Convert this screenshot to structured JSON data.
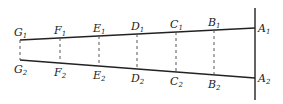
{
  "diagram": {
    "type": "geometric-figure",
    "colors": {
      "line": "#222222",
      "background": "#ffffff"
    },
    "vertical_line": {
      "x": 255,
      "y1": 8,
      "y2": 100
    },
    "top_line": {
      "x1": 20,
      "y1": 40,
      "x2": 255,
      "y2": 28
    },
    "bottom_line": {
      "x1": 20,
      "y1": 60,
      "x2": 255,
      "y2": 78
    },
    "points": [
      {
        "name": "G",
        "x": 20,
        "top_label": "G",
        "top_sub": "1",
        "bottom_label": "G",
        "bottom_sub": "2"
      },
      {
        "name": "F",
        "x": 60,
        "top_label": "F",
        "top_sub": "1",
        "bottom_label": "F",
        "bottom_sub": "2"
      },
      {
        "name": "E",
        "x": 99,
        "top_label": "E",
        "top_sub": "1",
        "bottom_label": "E",
        "bottom_sub": "2"
      },
      {
        "name": "D",
        "x": 137,
        "top_label": "D",
        "top_sub": "1",
        "bottom_label": "D",
        "bottom_sub": "2"
      },
      {
        "name": "C",
        "x": 176,
        "top_label": "C",
        "top_sub": "1",
        "bottom_label": "C",
        "bottom_sub": "2"
      },
      {
        "name": "B",
        "x": 214,
        "top_label": "B",
        "top_sub": "1",
        "bottom_label": "B",
        "bottom_sub": "2"
      },
      {
        "name": "A",
        "x": 255,
        "top_label": "A",
        "top_sub": "1",
        "bottom_label": "A",
        "bottom_sub": "2"
      }
    ]
  }
}
